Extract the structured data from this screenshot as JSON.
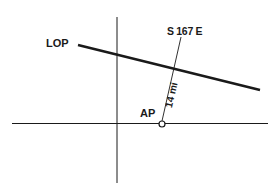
{
  "diagram": {
    "type": "navigation-plot",
    "labels": {
      "lop": "LOP",
      "bearing": "S 167 E",
      "ap": "AP",
      "distance": "14 mi"
    },
    "colors": {
      "ink": "#1a1a1a",
      "background": "#ffffff"
    }
  }
}
